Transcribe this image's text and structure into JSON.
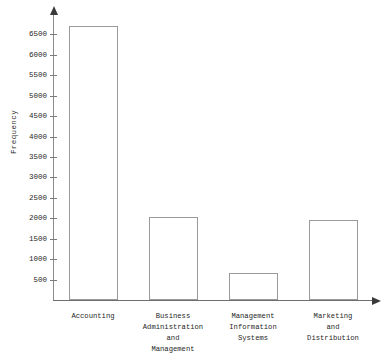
{
  "chart_data": {
    "type": "bar",
    "title": "",
    "xlabel": "",
    "ylabel": "Frequency",
    "categories": [
      "Accounting",
      "Business\nAdministration\nand\nManagement",
      "Management\nInformation\nSystems",
      "Marketing\nand\nDistribution"
    ],
    "values": [
      6700,
      2030,
      650,
      1950
    ],
    "ylim": [
      0,
      7000
    ],
    "yticks": [
      500,
      1000,
      1500,
      2000,
      2500,
      3000,
      3500,
      4000,
      4500,
      5000,
      5500,
      6000,
      6500
    ],
    "ytick_labels": [
      "500",
      "1000",
      "1500",
      "2000",
      "2500",
      "3000",
      "3500",
      "4000",
      "4500",
      "5000",
      "5500",
      "6000",
      "6500"
    ],
    "grid": false,
    "legend": null,
    "bar_fill_color": "#ffffff",
    "bar_edge_color": "#9a9a9a",
    "axis_color": "#7a7a7a",
    "text_color": "#1f1f1f"
  },
  "axis": {
    "y_title": "Frequency"
  }
}
